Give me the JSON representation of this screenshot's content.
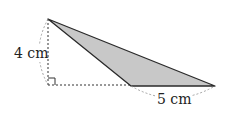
{
  "diagram": {
    "type": "geometry-triangle",
    "shaded_color": "#c8c8c8",
    "stroke_color": "#2a2a2a",
    "labels": {
      "height": "4 cm",
      "base": "5 cm"
    },
    "right_angle_marker": true
  }
}
